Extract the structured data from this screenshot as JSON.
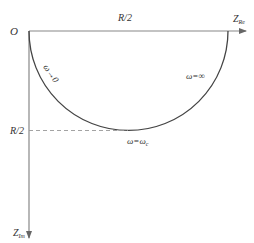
{
  "diagram": {
    "type": "nyquist-impedance-semicircle",
    "colors": {
      "axis": "#888888",
      "curve": "#444444",
      "dashed": "#999999",
      "text": "#333333"
    },
    "origin_label": "O",
    "x_axis": {
      "label": "Z",
      "label_sub": "Re"
    },
    "y_axis": {
      "label": "Z",
      "label_sub": "Im"
    },
    "top_label": "R/2",
    "left_label": "R/2",
    "annotations": {
      "low_freq": "ω→0",
      "high_freq": "ω=∞",
      "critical": "ω=ω",
      "critical_sub": "c"
    }
  }
}
